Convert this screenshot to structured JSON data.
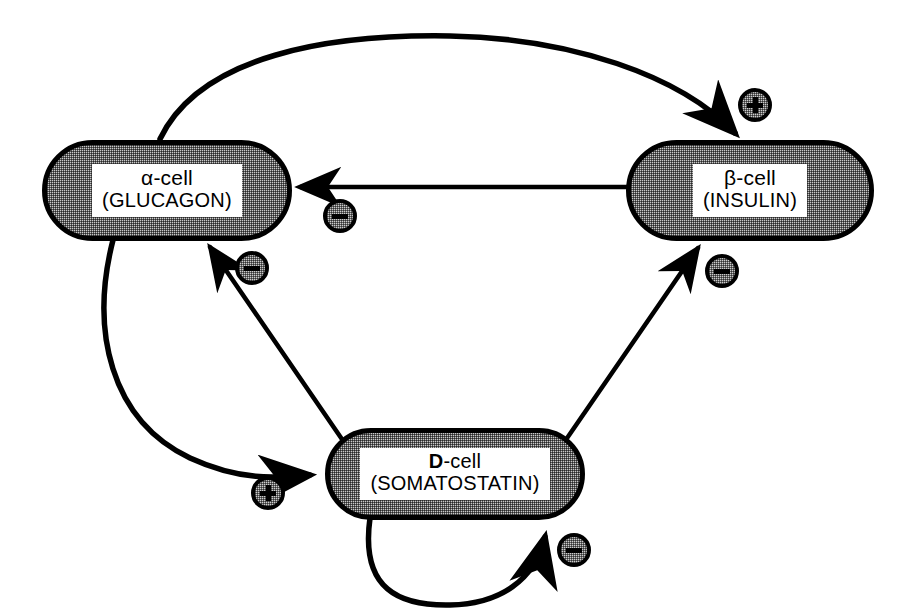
{
  "diagram": {
    "background_color": "#ffffff",
    "line_color": "#000000",
    "node_fill_color": "#c9c9c9",
    "label_panel_color": "#ffffff",
    "nodes": [
      {
        "id": "alpha",
        "name": "alpha-cell",
        "line1": "α-cell",
        "line2": "(GLUCAGON)"
      },
      {
        "id": "beta",
        "name": "beta-cell",
        "line1": "β-cell",
        "line2": "(INSULIN)"
      },
      {
        "id": "dcell",
        "name": "D-cell",
        "line1_bold": "D",
        "line1_rest": "-cell",
        "line2": "(SOMATOSTATIN)"
      }
    ],
    "edges": [
      {
        "id": "alpha-to-beta",
        "source": "alpha",
        "target": "beta",
        "sign": "+",
        "shape": "arc-over-top",
        "description": "glucagon stimulates insulin secretion"
      },
      {
        "id": "beta-to-alpha",
        "source": "beta",
        "target": "alpha",
        "sign": "−",
        "shape": "straight-horizontal",
        "description": "insulin inhibits glucagon secretion"
      },
      {
        "id": "dcell-to-alpha",
        "source": "dcell",
        "target": "alpha",
        "sign": "−",
        "shape": "straight-diagonal",
        "description": "somatostatin inhibits glucagon secretion"
      },
      {
        "id": "dcell-to-beta",
        "source": "dcell",
        "target": "beta",
        "sign": "−",
        "shape": "straight-diagonal",
        "description": "somatostatin inhibits insulin secretion"
      },
      {
        "id": "alpha-to-dcell",
        "source": "alpha",
        "target": "dcell",
        "sign": "+",
        "shape": "curve-left-sweep",
        "description": "glucagon stimulates somatostatin secretion"
      },
      {
        "id": "dcell-self",
        "source": "dcell",
        "target": "dcell",
        "sign": "−",
        "shape": "self-loop-bottom",
        "description": "somatostatin inhibits its own secretion"
      }
    ],
    "signs": {
      "plus": "+",
      "minus": "−"
    }
  }
}
